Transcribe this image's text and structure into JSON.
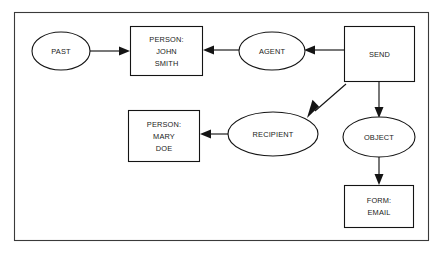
{
  "diagram": {
    "type": "conceptual-graph",
    "frame": {
      "name": "diagram-border"
    },
    "nodes": [
      {
        "id": "past",
        "shape": "ellipse",
        "kind": "concept",
        "lines": [
          "PAST"
        ],
        "cx": 61,
        "cy": 51,
        "rx": 29,
        "ry": 19
      },
      {
        "id": "john-smith",
        "shape": "rectangle",
        "kind": "concept",
        "lines": [
          "PERSON:",
          "JOHN",
          "SMITH"
        ],
        "x": 130,
        "y": 26,
        "w": 73,
        "h": 50
      },
      {
        "id": "agent",
        "shape": "ellipse",
        "kind": "relation",
        "lines": [
          "AGENT"
        ],
        "cx": 272,
        "cy": 51,
        "rx": 33,
        "ry": 19
      },
      {
        "id": "send",
        "shape": "rectangle",
        "kind": "concept",
        "lines": [
          "SEND"
        ],
        "x": 344,
        "y": 26,
        "w": 71,
        "h": 56
      },
      {
        "id": "mary-doe",
        "shape": "rectangle",
        "kind": "concept",
        "lines": [
          "PERSON:",
          "MARY",
          "DOE"
        ],
        "x": 128,
        "y": 110,
        "w": 72,
        "h": 52
      },
      {
        "id": "recipient",
        "shape": "ellipse",
        "kind": "relation",
        "lines": [
          "RECIPIENT"
        ],
        "cx": 273,
        "cy": 134,
        "rx": 45,
        "ry": 22
      },
      {
        "id": "object",
        "shape": "ellipse",
        "kind": "relation",
        "lines": [
          "OBJECT"
        ],
        "cx": 379,
        "cy": 137,
        "rx": 36,
        "ry": 20
      },
      {
        "id": "form-email",
        "shape": "rectangle",
        "kind": "concept",
        "lines": [
          "FORM:",
          "EMAIL"
        ],
        "x": 344,
        "y": 185,
        "w": 70,
        "h": 43
      }
    ],
    "edges": [
      {
        "id": "past-to-john",
        "from": "past",
        "to": "john-smith",
        "direction": "right"
      },
      {
        "id": "agent-to-john",
        "from": "agent",
        "to": "john-smith",
        "direction": "left"
      },
      {
        "id": "send-to-agent",
        "from": "send",
        "to": "agent",
        "direction": "left"
      },
      {
        "id": "send-to-recipient",
        "from": "send",
        "to": "recipient",
        "direction": "diagonal-down-left"
      },
      {
        "id": "send-to-object",
        "from": "send",
        "to": "object",
        "direction": "down"
      },
      {
        "id": "recipient-to-mary",
        "from": "recipient",
        "to": "mary-doe",
        "direction": "left"
      },
      {
        "id": "object-to-form",
        "from": "object",
        "to": "form-email",
        "direction": "down"
      }
    ]
  },
  "colors": {
    "background": "#ffffff",
    "stroke": "#141414",
    "frame_stroke": "#3a3a3a",
    "text": "#1a1a1a"
  }
}
